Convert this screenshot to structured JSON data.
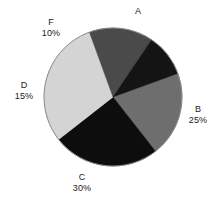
{
  "chart_data": {
    "type": "pie",
    "title": "",
    "subtitle": "",
    "xlabel": "",
    "ylabel": "",
    "grid": false,
    "legend_position": "none",
    "labels_outside": true,
    "start_angle_deg": -20,
    "direction": "clockwise",
    "categories": [
      "A",
      "B",
      "C",
      "D",
      "F"
    ],
    "values": [
      20,
      25,
      30,
      15,
      10
    ],
    "units": "percent",
    "slices": [
      {
        "label": "A",
        "percent_text": "",
        "value": 20,
        "color": "#6e6e6e"
      },
      {
        "label": "B",
        "percent_text": "25%",
        "value": 25,
        "color": "#0d0d0d"
      },
      {
        "label": "C",
        "percent_text": "30%",
        "value": 30,
        "color": "#d4d4d4"
      },
      {
        "label": "D",
        "percent_text": "15%",
        "value": 15,
        "color": "#4a4a4a"
      },
      {
        "label": "F",
        "percent_text": "10%",
        "value": 10,
        "color": "#141414"
      }
    ]
  },
  "labels": {
    "a": {
      "name": "A",
      "percent": ""
    },
    "b": {
      "name": "B",
      "percent": "25%"
    },
    "c": {
      "name": "C",
      "percent": "30%"
    },
    "d": {
      "name": "D",
      "percent": "15%"
    },
    "f": {
      "name": "F",
      "percent": "10%"
    }
  },
  "colors": {
    "background": "#ffffff",
    "text": "#1a1a1a",
    "outline": "#8a8a8a",
    "slice_a": "#6e6e6e",
    "slice_b": "#0d0d0d",
    "slice_c": "#d4d4d4",
    "slice_d": "#4a4a4a",
    "slice_f": "#141414"
  },
  "geometry": {
    "center_x": 113,
    "center_y": 97,
    "radius": 69
  }
}
